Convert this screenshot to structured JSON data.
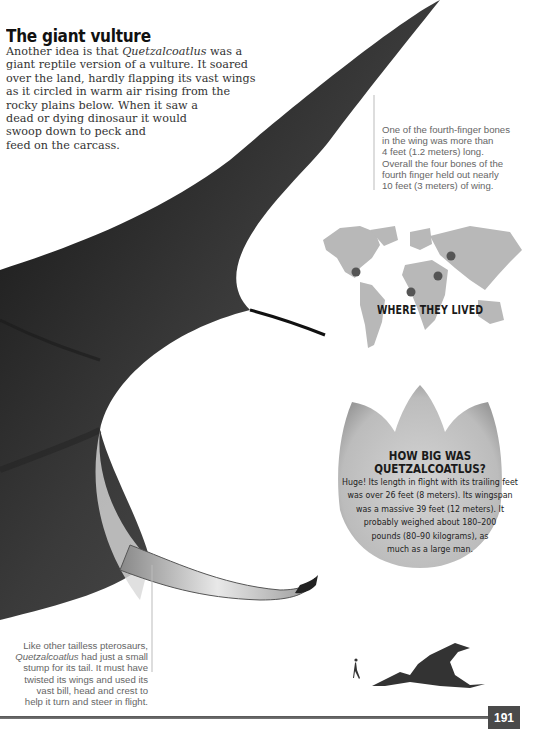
{
  "section": {
    "heading": "The giant vulture",
    "intro_lines": [
      "Another idea is that ",
      "giant reptile version of a vulture. It soared",
      "over the land, hardly flapping its vast wings",
      "as it circled in warm air rising from the",
      "rocky plains below. When it saw a",
      "dead or dying dinosaur it would",
      "swoop down to peck and",
      "feed on the carcass."
    ],
    "intro_italic": "Quetzalcoatlus",
    "intro_line1_tail": " was a"
  },
  "captions": {
    "finger_bones": [
      "One of the fourth-finger bones",
      "in the wing was more than",
      "4 feet (1.2 meters) long.",
      "Overall the four bones of the",
      "fourth finger held out nearly",
      "10 feet (3 meters) of wing."
    ],
    "tail": {
      "line1": "Like other tailless pterosaurs,",
      "line2_italic": "Quetzalcoatlus",
      "line2_tail": " had just a small",
      "line3": "stump for its tail. It must have",
      "line4": "twisted its wings and used its",
      "line5": "vast bill, head and crest to",
      "line6": "help it turn and steer in flight."
    }
  },
  "map": {
    "label": "WHERE THEY LIVED",
    "fossil_sites": [
      "North America",
      "North Africa",
      "Middle East",
      "Russia"
    ],
    "land_color": "#b8b8b8",
    "dot_color": "#555555"
  },
  "how_big": {
    "title_line1": "HOW BIG WAS",
    "title_line2": "QUETZALCOATLUS?",
    "body_lines": [
      "Huge! Its length in flight with its trailing feet",
      "was over 26 feet (8 meters). Its wingspan",
      "was a massive 39 feet (12 meters). It",
      "probably weighed about 180–200",
      "pounds (80–90 kilograms), as",
      "much as a large man."
    ]
  },
  "scale_graphic": {
    "human_icon": "running-man-icon",
    "pterosaur_icon": "pterosaur-silhouette-icon"
  },
  "footer": {
    "page_number": "191"
  }
}
